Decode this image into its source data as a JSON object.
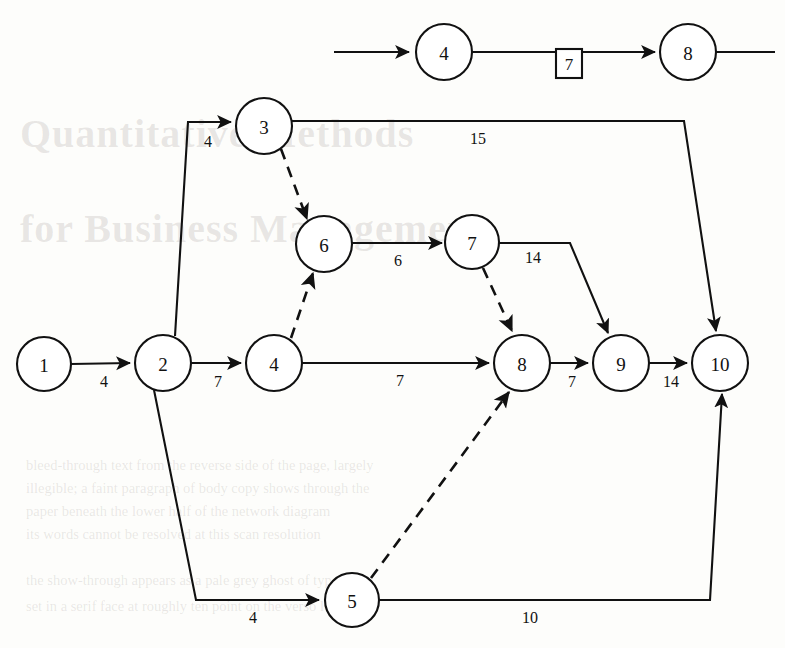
{
  "figure": {
    "type": "activity-on-node-network-diagram",
    "width": 785,
    "height": 648,
    "ink_color": "#111111",
    "paper_color": "#fdfdfb"
  },
  "top_fragment": {
    "caption": "partial network strip",
    "nodes": [
      {
        "id": "t4",
        "label": "4",
        "cx": 444,
        "cy": 52,
        "r": 28
      },
      {
        "id": "t8",
        "label": "8",
        "cx": 688,
        "cy": 52,
        "r": 28
      }
    ],
    "box": {
      "label": "7",
      "x": 556,
      "y": 49,
      "w": 24,
      "h": 28
    },
    "edges": [
      {
        "from": "inflow",
        "to": "t4",
        "style": "solid",
        "arrow": true,
        "label": ""
      },
      {
        "from": "t4",
        "to": "t8",
        "style": "solid",
        "arrow": true,
        "label": "7",
        "label_in_box": true
      },
      {
        "from": "t8",
        "to": "outflow",
        "style": "solid",
        "arrow": false,
        "label": ""
      }
    ]
  },
  "network": {
    "nodes": [
      {
        "id": "n1",
        "label": "1",
        "cx": 44,
        "cy": 364,
        "r": 27
      },
      {
        "id": "n2",
        "label": "2",
        "cx": 163,
        "cy": 363,
        "r": 28
      },
      {
        "id": "n3",
        "label": "3",
        "cx": 264,
        "cy": 126,
        "r": 28
      },
      {
        "id": "n4",
        "label": "4",
        "cx": 274,
        "cy": 363,
        "r": 28
      },
      {
        "id": "n5",
        "label": "5",
        "cx": 352,
        "cy": 600,
        "r": 27
      },
      {
        "id": "n6",
        "label": "6",
        "cx": 324,
        "cy": 244,
        "r": 28
      },
      {
        "id": "n7",
        "label": "7",
        "cx": 472,
        "cy": 242,
        "r": 27
      },
      {
        "id": "n8",
        "label": "8",
        "cx": 522,
        "cy": 363,
        "r": 28
      },
      {
        "id": "n9",
        "label": "9",
        "cx": 621,
        "cy": 363,
        "r": 28
      },
      {
        "id": "n10",
        "label": "10",
        "cx": 720,
        "cy": 363,
        "r": 28
      }
    ],
    "edges": [
      {
        "id": "e1",
        "from": "n1",
        "to": "n2",
        "style": "solid",
        "arrow": true,
        "label": "4",
        "label_x": 104,
        "label_y": 381
      },
      {
        "id": "e2",
        "from": "n2",
        "to": "n3",
        "style": "solid",
        "arrow": true,
        "label": "4",
        "label_x": 208,
        "label_y": 141
      },
      {
        "id": "e3",
        "from": "n2",
        "to": "n4",
        "style": "solid",
        "arrow": true,
        "label": "7",
        "label_x": 218,
        "label_y": 381
      },
      {
        "id": "e4",
        "from": "n2",
        "to": "n5",
        "style": "solid",
        "arrow": true,
        "label": "4",
        "label_x": 253,
        "label_y": 617
      },
      {
        "id": "e5",
        "from": "n3",
        "to": "n10",
        "style": "solid",
        "arrow": true,
        "label": "15",
        "label_x": 478,
        "label_y": 138
      },
      {
        "id": "e6",
        "from": "n3",
        "to": "n6",
        "style": "dashed",
        "arrow": true,
        "label": ""
      },
      {
        "id": "e7",
        "from": "n4",
        "to": "n6",
        "style": "dashed",
        "arrow": true,
        "label": ""
      },
      {
        "id": "e8",
        "from": "n4",
        "to": "n8",
        "style": "solid",
        "arrow": true,
        "label": "7",
        "label_x": 400,
        "label_y": 380
      },
      {
        "id": "e9",
        "from": "n6",
        "to": "n7",
        "style": "solid",
        "arrow": true,
        "label": "6",
        "label_x": 398,
        "label_y": 260
      },
      {
        "id": "e10",
        "from": "n7",
        "to": "n8",
        "style": "dashed",
        "arrow": true,
        "label": ""
      },
      {
        "id": "e11",
        "from": "n7",
        "to": "n9",
        "style": "solid",
        "arrow": true,
        "label": "14",
        "label_x": 533,
        "label_y": 257
      },
      {
        "id": "e12",
        "from": "n5",
        "to": "n8",
        "style": "dashed",
        "arrow": true,
        "label": ""
      },
      {
        "id": "e13",
        "from": "n5",
        "to": "n10",
        "style": "solid",
        "arrow": true,
        "label": "10",
        "label_x": 530,
        "label_y": 617
      },
      {
        "id": "e14",
        "from": "n8",
        "to": "n9",
        "style": "solid",
        "arrow": true,
        "label": "7",
        "label_x": 572,
        "label_y": 381
      },
      {
        "id": "e15",
        "from": "n9",
        "to": "n10",
        "style": "solid",
        "arrow": true,
        "label": "14",
        "label_x": 671,
        "label_y": 381
      }
    ]
  },
  "background_text": {
    "title_line_1": "Quantitative Methods",
    "title_line_2": "for Business Management",
    "body_lines": [
      "bleed-through text from the reverse side of the page, largely",
      "illegible; a faint paragraph of body copy shows through the",
      "paper beneath the lower half of the network diagram",
      "its words cannot be resolved at this scan resolution",
      "the show-through appears as a pale grey ghost of type",
      "set in a serif face at roughly ten point on the verso leaf"
    ]
  }
}
